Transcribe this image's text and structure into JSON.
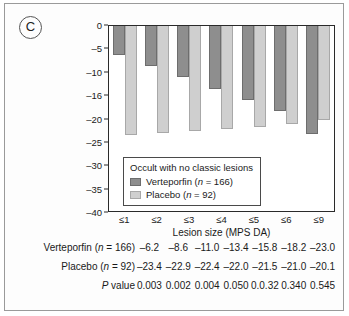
{
  "panel": {
    "label": "C"
  },
  "chart_data": {
    "type": "bar",
    "title": "",
    "subtitle": "",
    "xlabel": "Lesion size (MPS DA)",
    "ylabel": "",
    "categories": [
      "≤1",
      "≤2",
      "≤3",
      "≤4",
      "≤5",
      "≤6",
      "≤9"
    ],
    "ylim": [
      -40,
      0
    ],
    "y_ticks": [
      0,
      -5,
      -10,
      -15,
      -20,
      -25,
      -30,
      -35,
      -40
    ],
    "y_tick_labels": [
      "0",
      "–5",
      "–10",
      "–16",
      "–20",
      "–25",
      "–30",
      "–35",
      "–40"
    ],
    "grid": false,
    "legend_position": "inside-bottom-left",
    "legend_title": "Occult with no classic lesions",
    "series": [
      {
        "name": "Verteporfin (n = 166)",
        "key": "verteporfin",
        "color": "#8e8e8e",
        "values": [
          -6.2,
          -8.6,
          -11.0,
          -13.4,
          -15.8,
          -18.2,
          -23.0
        ]
      },
      {
        "name": "Placebo (n = 92)",
        "key": "placebo",
        "color": "#cfcfcf",
        "values": [
          -23.4,
          -22.9,
          -22.4,
          -22.0,
          -21.5,
          -21.0,
          -20.1
        ]
      }
    ]
  },
  "legend": {
    "title": "Occult with no classic lesions",
    "entries": [
      {
        "label_prefix": "Verteporfin (",
        "label_italic": "n",
        "label_suffix": " = 166)"
      },
      {
        "label_prefix": "Placebo (",
        "label_italic": "n",
        "label_suffix": " = 92)"
      }
    ]
  },
  "table": {
    "rows": [
      {
        "label_prefix": "Verteporfin (",
        "label_italic": "n",
        "label_suffix": " = 166)",
        "values": [
          "–6.2",
          "–8.6",
          "–11.0",
          "–13.4",
          "–15.8",
          "–18.2",
          "–23.0"
        ]
      },
      {
        "label_prefix": "Placebo (",
        "label_italic": "n",
        "label_suffix": " = 92)",
        "values": [
          "–23.4",
          "–22.9",
          "–22.4",
          "–22.0",
          "–21.5",
          "–21.0",
          "–20.1"
        ]
      },
      {
        "label_prefix": "",
        "label_italic": "P",
        "label_suffix": " value",
        "values": [
          "0.003",
          "0.002",
          "0.004",
          "0.050",
          "0.0.32",
          "0.340",
          "0.545"
        ]
      }
    ]
  }
}
